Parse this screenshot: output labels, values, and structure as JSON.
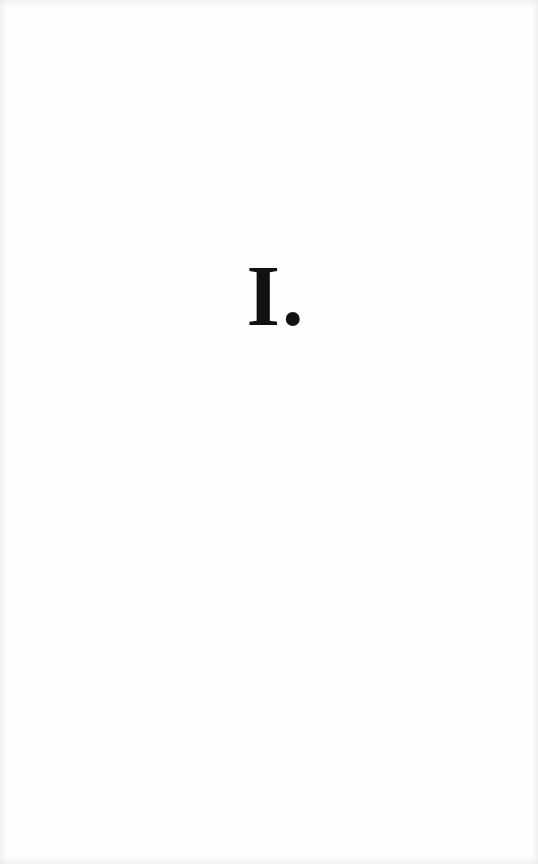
{
  "page": {
    "type": "section-title-page",
    "heading": "I."
  }
}
